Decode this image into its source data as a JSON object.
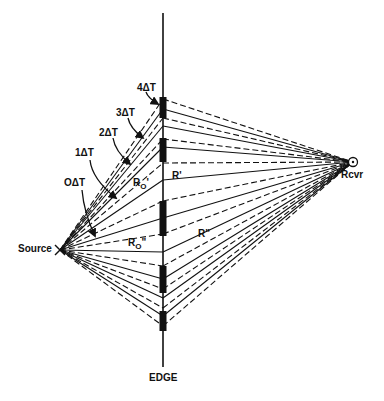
{
  "diagram": {
    "type": "ray-path diffraction diagram",
    "colors": {
      "ink": "#111111",
      "background": "#ffffff"
    },
    "source": {
      "label": "Source",
      "x": 60,
      "y": 250
    },
    "receiver": {
      "label": "Rcvr",
      "x": 353,
      "y": 162
    },
    "edge": {
      "label": "EDGE",
      "x": 163,
      "y_top": 13,
      "y_bottom": 367,
      "segments": [
        [
          97,
          118
        ],
        [
          138,
          162
        ],
        [
          201,
          236
        ],
        [
          266,
          293
        ],
        [
          311,
          331
        ]
      ]
    },
    "ray_edge_points": [
      {
        "y": 99,
        "style": "dash"
      },
      {
        "y": 109,
        "style": "solid"
      },
      {
        "y": 118,
        "style": "dash"
      },
      {
        "y": 126,
        "style": "solid"
      },
      {
        "y": 139,
        "style": "dash"
      },
      {
        "y": 147,
        "style": "solid"
      },
      {
        "y": 163,
        "style": "dash"
      },
      {
        "y": 180,
        "style": "solid"
      },
      {
        "y": 201,
        "style": "dash"
      },
      {
        "y": 218,
        "style": "solid"
      },
      {
        "y": 234,
        "style": "dash"
      },
      {
        "y": 252,
        "style": "solid"
      },
      {
        "y": 266,
        "style": "dash"
      },
      {
        "y": 279,
        "style": "solid"
      },
      {
        "y": 289,
        "style": "dash"
      },
      {
        "y": 298,
        "style": "solid"
      },
      {
        "y": 308,
        "style": "dash"
      },
      {
        "y": 316,
        "style": "solid"
      },
      {
        "y": 326,
        "style": "dash"
      }
    ],
    "time_labels": [
      {
        "text": "4ΔT",
        "x": 137,
        "y": 83,
        "arrow": [
          [
            146,
            92
          ],
          [
            158,
            104
          ]
        ]
      },
      {
        "text": "3ΔT",
        "x": 116,
        "y": 108,
        "arrow": [
          [
            128,
            118
          ],
          [
            143,
            138
          ]
        ]
      },
      {
        "text": "2ΔT",
        "x": 99,
        "y": 128,
        "arrow": [
          [
            113,
            138
          ],
          [
            130,
            164
          ]
        ]
      },
      {
        "text": "1ΔT",
        "x": 75,
        "y": 148,
        "arrow": [
          [
            90,
            160
          ],
          [
            116,
            198
          ]
        ]
      },
      {
        "text": "OΔT",
        "x": 64,
        "y": 178,
        "arrow": [
          [
            82,
            190
          ],
          [
            95,
            236
          ]
        ]
      }
    ],
    "path_labels": [
      {
        "base": "R",
        "sub": "O",
        "prime": "'",
        "x": 133,
        "y": 178
      },
      {
        "base": "R",
        "sub": "",
        "prime": "'",
        "x": 172,
        "y": 171
      },
      {
        "base": "R",
        "sub": "O",
        "prime": "\"",
        "x": 128,
        "y": 238
      },
      {
        "base": "R",
        "sub": "",
        "prime": "\"",
        "x": 198,
        "y": 229
      }
    ]
  }
}
